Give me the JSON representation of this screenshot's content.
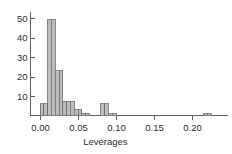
{
  "chart_data": {
    "type": "bar",
    "title": "",
    "subtitle": "",
    "xlabel": "Leverages",
    "ylabel": "",
    "grid": false,
    "legend": null,
    "legend_position": "none",
    "xlim": [
      -0.012,
      0.245
    ],
    "ylim": [
      0,
      52
    ],
    "xticks": [
      0.0,
      0.05,
      0.1,
      0.15,
      0.2
    ],
    "xtick_labels": [
      "0.00",
      "0.05",
      "0.10",
      "0.15",
      "0.20"
    ],
    "yticks": [
      10,
      20,
      30,
      40,
      50
    ],
    "ytick_labels": [
      "10",
      "20",
      "30",
      "40",
      "50"
    ],
    "bin_width": 0.005,
    "bin_edges": [
      0.0,
      0.005,
      0.01,
      0.015,
      0.02,
      0.025,
      0.03,
      0.035,
      0.04,
      0.045,
      0.05,
      0.055,
      0.06,
      0.065,
      0.07,
      0.075,
      0.08,
      0.085,
      0.09,
      0.095,
      0.1,
      0.215,
      0.22,
      0.225
    ],
    "bars": [
      {
        "x0": 0.0,
        "x1": 0.005,
        "height": 6
      },
      {
        "x0": 0.005,
        "x1": 0.01,
        "height": 6
      },
      {
        "x0": 0.01,
        "x1": 0.015,
        "height": 49
      },
      {
        "x0": 0.015,
        "x1": 0.02,
        "height": 49
      },
      {
        "x0": 0.02,
        "x1": 0.025,
        "height": 23
      },
      {
        "x0": 0.025,
        "x1": 0.03,
        "height": 23
      },
      {
        "x0": 0.03,
        "x1": 0.035,
        "height": 7
      },
      {
        "x0": 0.035,
        "x1": 0.04,
        "height": 7
      },
      {
        "x0": 0.04,
        "x1": 0.045,
        "height": 7
      },
      {
        "x0": 0.045,
        "x1": 0.05,
        "height": 3
      },
      {
        "x0": 0.05,
        "x1": 0.055,
        "height": 3
      },
      {
        "x0": 0.055,
        "x1": 0.06,
        "height": 1
      },
      {
        "x0": 0.06,
        "x1": 0.065,
        "height": 1
      },
      {
        "x0": 0.08,
        "x1": 0.085,
        "height": 6
      },
      {
        "x0": 0.085,
        "x1": 0.09,
        "height": 6
      },
      {
        "x0": 0.09,
        "x1": 0.095,
        "height": 1
      },
      {
        "x0": 0.095,
        "x1": 0.1,
        "height": 1
      },
      {
        "x0": 0.215,
        "x1": 0.22,
        "height": 1
      },
      {
        "x0": 0.22,
        "x1": 0.225,
        "height": 1
      }
    ],
    "colors": {
      "bar_fill": "#bdbdbd",
      "bar_stroke": "#6b6b6b",
      "axis": "#5e5e5e",
      "text": "#2b2b2b",
      "background": "#ffffff"
    }
  }
}
